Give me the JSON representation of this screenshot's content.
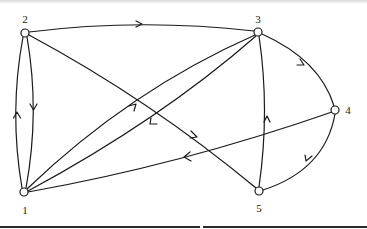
{
  "diagram": {
    "type": "directed-graph",
    "nodes": [
      {
        "id": "1",
        "label": "1",
        "x": 24,
        "y": 192,
        "label_x": 25,
        "label_y": 210
      },
      {
        "id": "2",
        "label": "2",
        "x": 25,
        "y": 33,
        "label_x": 25,
        "label_y": 19
      },
      {
        "id": "3",
        "label": "3",
        "x": 258,
        "y": 32,
        "label_x": 258,
        "label_y": 19
      },
      {
        "id": "4",
        "label": "4",
        "x": 335,
        "y": 110,
        "label_x": 348,
        "label_y": 110
      },
      {
        "id": "5",
        "label": "5",
        "x": 259,
        "y": 191,
        "label_x": 259,
        "label_y": 208
      }
    ],
    "edges": [
      {
        "from": "2",
        "to": "3"
      },
      {
        "from": "2",
        "to": "1"
      },
      {
        "from": "1",
        "to": "2"
      },
      {
        "from": "1",
        "to": "3"
      },
      {
        "from": "3",
        "to": "1"
      },
      {
        "from": "2",
        "to": "5"
      },
      {
        "from": "4",
        "to": "1"
      },
      {
        "from": "3",
        "to": "4"
      },
      {
        "from": "4",
        "to": "5"
      },
      {
        "from": "5",
        "to": "3"
      }
    ],
    "colors": {
      "stroke": "#1a1a1a",
      "node_fill": "#ffffff",
      "background": "#ffffff"
    }
  }
}
